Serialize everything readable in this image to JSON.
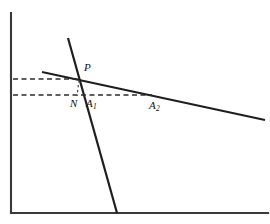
{
  "figure": {
    "background_color": "#ffffff",
    "width": 270,
    "height": 224,
    "axes": {
      "color": "#3a3a3a",
      "y_axis": {
        "name": "vertical-axis",
        "x": 11,
        "y_top": 13,
        "y_bottom": 213
      },
      "x_axis": {
        "name": "horizontal-axis",
        "y": 213,
        "x_left": 11,
        "x_right": 268
      }
    },
    "lines": [
      {
        "name": "steep-line",
        "description": "steep descending line through P",
        "color": "#1e1e1e",
        "x1": 68,
        "y1": 38,
        "x2": 117,
        "y2": 213
      },
      {
        "name": "shallow-line",
        "description": "shallow descending line through P and A2",
        "color": "#1e1e1e",
        "x1": 42,
        "y1": 72,
        "x2": 265,
        "y2": 120
      }
    ],
    "dashed_lines": [
      {
        "name": "upper-ordinate-dash",
        "color": "#2b2b2b",
        "x1": 13,
        "y1": 79,
        "x2": 81,
        "y2": 79
      },
      {
        "name": "lower-ordinate-dash",
        "color": "#2b2b2b",
        "x1": 13,
        "y1": 95,
        "x2": 152,
        "y2": 95
      },
      {
        "name": "drop-segment-p-to-n",
        "color": "#4a4a4a",
        "x1": 79,
        "y1": 80,
        "x2": 77,
        "y2": 96
      }
    ],
    "labels": [
      {
        "name": "label-p",
        "text": "P",
        "sub": "",
        "x": 84,
        "y": 62
      },
      {
        "name": "label-n",
        "text": "N",
        "sub": "",
        "x": 70,
        "y": 98
      },
      {
        "name": "label-a1",
        "text": "A",
        "sub": "1",
        "x": 86,
        "y": 98
      },
      {
        "name": "label-a2",
        "text": "A",
        "sub": "2",
        "x": 149,
        "y": 100
      }
    ]
  }
}
